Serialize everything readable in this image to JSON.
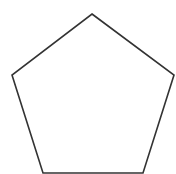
{
  "diagram": {
    "shape": "pentagon",
    "fill": "#ffffff",
    "stroke": "#333333",
    "stroke_width": 1.6,
    "points": "92,14 174,75 143,173 43,173 12,75"
  }
}
